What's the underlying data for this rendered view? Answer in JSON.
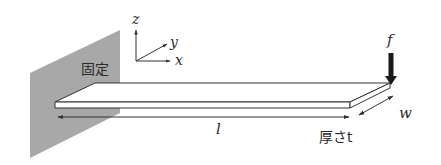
{
  "diagram": {
    "colors": {
      "wall": "#a8a8a8",
      "line": "#333333",
      "beam_fill": "#ffffff",
      "force_arrow": "#1a1a1a",
      "text": "#2a2a2a"
    },
    "labels": {
      "fixed": "固定",
      "length": "l",
      "thickness": "厚さt",
      "width": "w",
      "force": "f"
    },
    "axes": {
      "x": "x",
      "y": "y",
      "z": "z"
    },
    "nodes": [
      {
        "id": "wall",
        "label": "固定",
        "kind": "fixed-support"
      },
      {
        "id": "beam",
        "label": "",
        "kind": "thin-plate-beam"
      },
      {
        "id": "load",
        "label": "f",
        "kind": "point-force"
      },
      {
        "id": "axes",
        "label": "x, y, z",
        "kind": "coordinate-system"
      }
    ],
    "dimensions": [
      {
        "name": "length",
        "label": "l"
      },
      {
        "name": "thickness",
        "label": "厚さt"
      },
      {
        "name": "width",
        "label": "w"
      }
    ]
  }
}
